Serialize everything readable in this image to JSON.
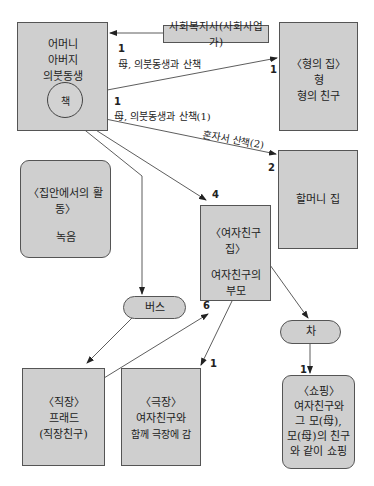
{
  "nodes": {
    "family": {
      "lines": [
        "어머니",
        "아버지",
        "의붓동생"
      ]
    },
    "self": {
      "label": "책"
    },
    "social_worker": {
      "label": "사회복지사(사회사업가)"
    },
    "brother_house": {
      "lines": [
        "〈형의 집〉",
        "형",
        "형의 친구"
      ]
    },
    "grandma_house": {
      "label": "할머니 집"
    },
    "home_activity": {
      "title": "〈집안에서의 활동〉",
      "detail": "녹음"
    },
    "girlfriend_house": {
      "title": "〈여자친구 집〉",
      "lines": [
        "여자친구의",
        "부모"
      ]
    },
    "bus": {
      "label": "버스"
    },
    "car": {
      "label": "차"
    },
    "work": {
      "lines": [
        "〈직장〉",
        "프래드",
        "(직장친구)"
      ]
    },
    "theater": {
      "lines": [
        "〈극장〉",
        "여자친구와",
        "함께 극장에 감"
      ]
    },
    "shopping": {
      "lines": [
        "〈쇼핑〉",
        "여자친구와",
        "그 모(母),",
        "모(母)의 친구",
        "와 같이 쇼핑"
      ]
    }
  },
  "edge_labels": {
    "walk_brother_num": "1",
    "walk_brother_text": "母, 의붓동생과 산책",
    "brother_end_num": "1",
    "walk1_num": "1",
    "walk1_text": "母, 의붓동생과 산책(1)",
    "walk2_text": "혼자서 산책(2)",
    "grandma_num": "2",
    "girlfriend_num": "4",
    "bus_to_gf_num": "6",
    "theater_num": "1",
    "shopping_num": "1"
  }
}
